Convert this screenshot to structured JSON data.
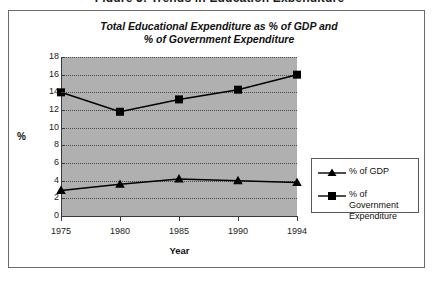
{
  "document": {
    "heading": "Figure 5: Trends in Education Expenditure"
  },
  "chart_data": {
    "type": "line",
    "title": "Total Educational Expenditure as % of GDP and % of Government Expenditure",
    "title_line1": "Total Educational Expenditure as % of GDP and",
    "title_line2": "% of Government Expenditure",
    "xlabel": "Year",
    "ylabel": "%",
    "categories": [
      "1975",
      "1980",
      "1985",
      "1990",
      "1994"
    ],
    "x": [
      1975,
      1980,
      1985,
      1990,
      1994
    ],
    "ylim": [
      0,
      18
    ],
    "ytick_labels": [
      "0",
      "2",
      "4",
      "6",
      "8",
      "10",
      "12",
      "14",
      "16",
      "18"
    ],
    "yticks": [
      0,
      2,
      4,
      6,
      8,
      10,
      12,
      14,
      16,
      18
    ],
    "grid": true,
    "legend_position": "right",
    "plot_background": "#b0b0b0",
    "series": [
      {
        "name": "% of GDP",
        "marker": "triangle",
        "color": "#000000",
        "values": [
          2.9,
          3.6,
          4.2,
          4.0,
          3.8
        ]
      },
      {
        "name": "% of Government Expenditure",
        "marker": "square",
        "color": "#000000",
        "values": [
          14.0,
          11.8,
          13.2,
          14.3,
          16.0
        ]
      }
    ]
  },
  "legend": {
    "items": [
      {
        "label": "% of GDP",
        "marker": "triangle"
      },
      {
        "label": "% of Government Expenditure",
        "marker": "square"
      }
    ]
  }
}
